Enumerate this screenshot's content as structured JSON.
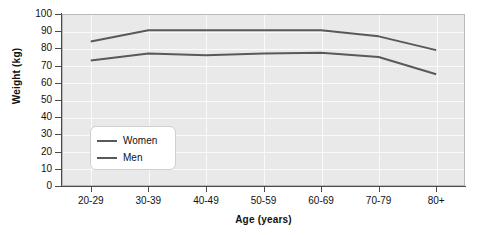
{
  "chart_data": {
    "type": "line",
    "title": "",
    "xlabel": "Age (years)",
    "ylabel": "Weight (kg)",
    "categories": [
      "20-29",
      "30-39",
      "40-49",
      "50-59",
      "60-69",
      "70-79",
      "80+"
    ],
    "series": [
      {
        "name": "Women",
        "values": [
          84,
          90.5,
          90.5,
          90.5,
          90.5,
          87,
          79
        ],
        "color": "#555a5e"
      },
      {
        "name": "Men",
        "values": [
          73,
          77,
          76,
          77,
          77.5,
          75,
          65
        ],
        "color": "#555a5e"
      }
    ],
    "ylim": [
      0,
      100
    ],
    "yticks": [
      0,
      10,
      20,
      30,
      40,
      50,
      60,
      70,
      80,
      90,
      100
    ],
    "ytick_labels": [
      "0",
      "10",
      "20",
      "30",
      "40",
      "50",
      "60",
      "70",
      "80",
      "90",
      "100"
    ],
    "grid": true,
    "legend_position": "lower-left-inside",
    "plot_background": "#e9e9e9",
    "gridline_color": "#fafafa",
    "axis_color": "#4a4a4a",
    "figure_background": "#ffffff"
  },
  "legend": {
    "items": [
      {
        "label": "Women"
      },
      {
        "label": "Men"
      }
    ]
  }
}
